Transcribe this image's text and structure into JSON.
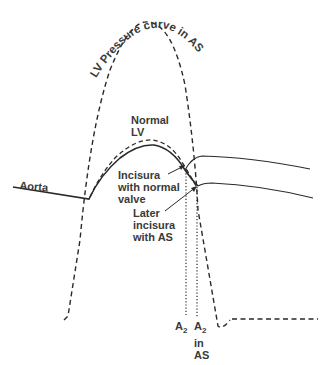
{
  "diagram": {
    "title_curve_label": "LV Pressure curve in AS",
    "labels": {
      "normal_lv": [
        "Normal",
        "LV"
      ],
      "aorta": "Aorta",
      "incisura_normal": [
        "Incisura",
        "with normal",
        "valve"
      ],
      "incisura_as": [
        "Later",
        "incisura",
        "with AS"
      ],
      "a2": "A",
      "a2_sub": "2",
      "a2_in_as": [
        "in",
        "AS"
      ]
    },
    "colors": {
      "line": "#2a2a2a",
      "text": "#3a3a3a",
      "background": "#ffffff"
    },
    "curves": [
      {
        "name": "LV pressure in AS",
        "style": "dashed"
      },
      {
        "name": "Normal LV",
        "style": "dashed"
      },
      {
        "name": "Aorta (normal valve)",
        "style": "solid"
      },
      {
        "name": "Aorta (with AS)",
        "style": "solid"
      },
      {
        "name": "A2 marker",
        "style": "dotted"
      },
      {
        "name": "A2 in AS marker",
        "style": "dotted"
      }
    ]
  }
}
